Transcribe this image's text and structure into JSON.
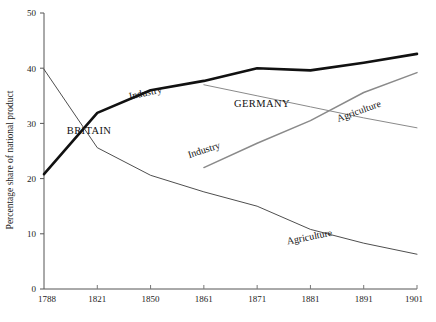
{
  "chart_data": {
    "type": "line",
    "title": "",
    "xlabel": "",
    "ylabel": "Percentage share of national product",
    "categories": [
      "1788",
      "1821",
      "1850",
      "1861",
      "1871",
      "1881",
      "1891",
      "1901"
    ],
    "x_tick_labels": [
      "1788",
      "1821",
      "1850",
      "1861",
      "1871",
      "1881",
      "1891",
      "1901"
    ],
    "y_tick_labels": [
      "0",
      "10",
      "20",
      "30",
      "40",
      "50"
    ],
    "y_ticks": [
      0,
      10,
      20,
      30,
      40,
      50
    ],
    "ylim": [
      0,
      50
    ],
    "grid": false,
    "legend": "inline-annotations",
    "series": [
      {
        "name": "Britain Industry",
        "country": "BRITAIN",
        "sector": "Industry",
        "color": "#111111",
        "width": 2.6,
        "x": [
          "1788",
          "1821",
          "1850",
          "1861",
          "1871",
          "1881",
          "1891",
          "1901"
        ],
        "values": [
          20.8,
          31.9,
          36.0,
          37.7,
          40.0,
          39.6,
          41.0,
          42.6
        ]
      },
      {
        "name": "Britain Agriculture",
        "country": "BRITAIN",
        "sector": "Agriculture",
        "color": "#3a3a3a",
        "width": 0.9,
        "x": [
          "1788",
          "1821",
          "1850",
          "1861",
          "1871",
          "1881",
          "1891",
          "1901"
        ],
        "values": [
          39.8,
          25.6,
          20.6,
          17.6,
          15.0,
          10.8,
          8.3,
          6.3
        ]
      },
      {
        "name": "Germany Industry",
        "country": "GERMANY",
        "sector": "Industry",
        "color": "#8a8a8a",
        "width": 1.5,
        "x": [
          "1861",
          "1871",
          "1881",
          "1891",
          "1901"
        ],
        "values": [
          22.0,
          26.4,
          30.5,
          35.6,
          39.2
        ]
      },
      {
        "name": "Germany Agriculture",
        "country": "GERMANY",
        "sector": "Agriculture",
        "color": "#8a8a8a",
        "width": 1.0,
        "x": [
          "1861",
          "1871",
          "1881",
          "1891",
          "1901"
        ],
        "values": [
          37.0,
          35.0,
          33.0,
          31.0,
          29.2
        ]
      }
    ],
    "annotations": [
      {
        "text": "Industry",
        "for": "Britain Industry",
        "x": 146,
        "y": 96,
        "rotation": -12
      },
      {
        "text": "BRITAIN",
        "for": "BRITAIN",
        "x": 89,
        "y": 134,
        "rotation": 0
      },
      {
        "text": "Agriculture",
        "for": "Britain Agriculture",
        "x": 310,
        "y": 240,
        "rotation": -11
      },
      {
        "text": "GERMANY",
        "for": "GERMANY",
        "x": 262,
        "y": 107,
        "rotation": 0
      },
      {
        "text": "Industry",
        "for": "Germany Industry",
        "x": 205,
        "y": 153,
        "rotation": -18
      },
      {
        "text": "Agriculture",
        "for": "Germany Agriculture",
        "x": 360,
        "y": 114,
        "rotation": -20
      }
    ]
  }
}
